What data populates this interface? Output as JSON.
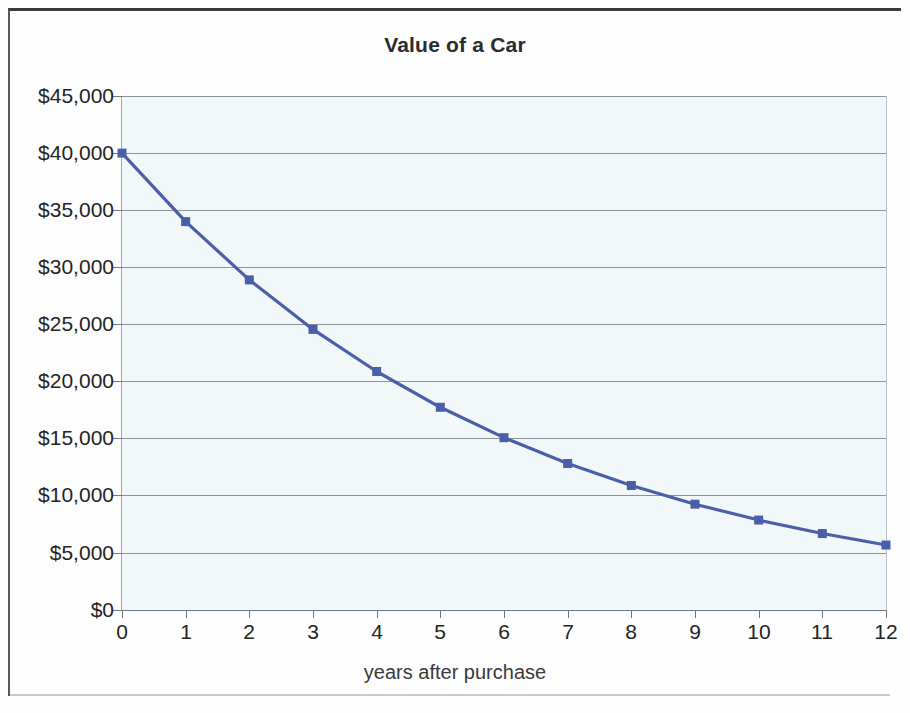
{
  "chart_data": {
    "type": "line",
    "title": "Value of a Car",
    "xlabel": "years after purchase",
    "ylabel": "",
    "x": [
      0,
      1,
      2,
      3,
      4,
      5,
      6,
      7,
      8,
      9,
      10,
      11,
      12
    ],
    "categories": [
      "0",
      "1",
      "2",
      "3",
      "4",
      "5",
      "6",
      "7",
      "8",
      "9",
      "10",
      "11",
      "12"
    ],
    "values": [
      40000,
      34000,
      28900,
      24565,
      20880,
      17748,
      15086,
      12823,
      10899,
      9264,
      7874,
      6693,
      5689
    ],
    "series": [
      {
        "name": "Value of a Car",
        "values": [
          40000,
          34000,
          28900,
          24565,
          20880,
          17748,
          15086,
          12823,
          10899,
          9264,
          7874,
          6693,
          5689
        ]
      }
    ],
    "xlim": [
      0,
      12
    ],
    "ylim": [
      0,
      45000
    ],
    "ytick_values": [
      0,
      5000,
      10000,
      15000,
      20000,
      25000,
      30000,
      35000,
      40000,
      45000
    ],
    "ytick_labels": [
      "$0",
      "$5,000",
      "$10,000",
      "$15,000",
      "$20,000",
      "$25,000",
      "$30,000",
      "$35,000",
      "$40,000",
      "$45,000"
    ],
    "xtick_labels": [
      "0",
      "1",
      "2",
      "3",
      "4",
      "5",
      "6",
      "7",
      "8",
      "9",
      "10",
      "11",
      "12"
    ],
    "grid": "horizontal",
    "legend": "none",
    "marker": "square",
    "line_color": "#4a5fa8",
    "marker_color": "#4a5fa8",
    "plot_background": "#f2f7f9",
    "gridline_color": "#8d9399",
    "title_color": "#2b2b2b"
  }
}
